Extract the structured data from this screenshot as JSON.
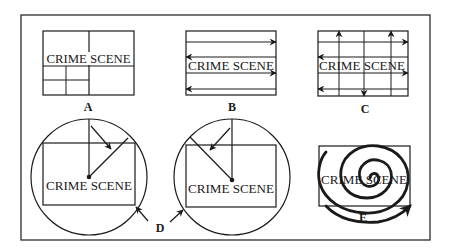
{
  "figure": {
    "scene_text": "CRIME SCENE",
    "panels": [
      {
        "id": "A",
        "label": "A",
        "pattern": "grid / quadrant (zone)",
        "scene_text": "CRIME SCENE"
      },
      {
        "id": "B",
        "label": "B",
        "pattern": "strip / line",
        "scene_text": "CRIME SCENE"
      },
      {
        "id": "C",
        "label": "C",
        "pattern": "double strip / grid",
        "scene_text": "CRIME SCENE"
      },
      {
        "id": "D1",
        "label": "D",
        "pattern": "wheel / ray (clockwise)",
        "scene_text": "CRIME SCENE"
      },
      {
        "id": "D2",
        "label": "D",
        "pattern": "wheel / ray (counter-clockwise)",
        "scene_text": "CRIME SCENE"
      },
      {
        "id": "E",
        "label": "E",
        "pattern": "spiral",
        "scene_text": "CRIME SCENE"
      }
    ],
    "shared_label_D": "D"
  },
  "colors": {
    "background": "#ffffff",
    "ink": "#1a1a1a"
  }
}
